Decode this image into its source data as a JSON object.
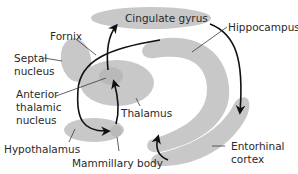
{
  "diagram": {
    "type": "anatomical-diagram",
    "labels": {
      "cingulate_gyrus": "Cingulate gyrus",
      "hippocampus": "Hippocampus",
      "fornix": "Fornix",
      "septal_nucleus_line1": "Septal",
      "septal_nucleus_line2": "nucleus",
      "anterior_thalamic_line1": "Anterior",
      "anterior_thalamic_line2": "thalamic",
      "anterior_thalamic_line3": "nucleus",
      "thalamus": "Thalamus",
      "hypothalamus": "Hypothalamus",
      "mammillary_body": "Mammillary body",
      "entorhinal_line1": "Entorhinal",
      "entorhinal_line2": "cortex"
    },
    "colors": {
      "region_fill": "#c8c8c8",
      "arrow_stroke": "#111111",
      "text": "#2a2a2a",
      "background": "#ffffff"
    },
    "circuit": [
      "Hippocampus",
      "Fornix",
      "Mammillary body",
      "Anterior thalamic nucleus",
      "Cingulate gyrus",
      "Entorhinal cortex",
      "Hippocampus"
    ]
  }
}
